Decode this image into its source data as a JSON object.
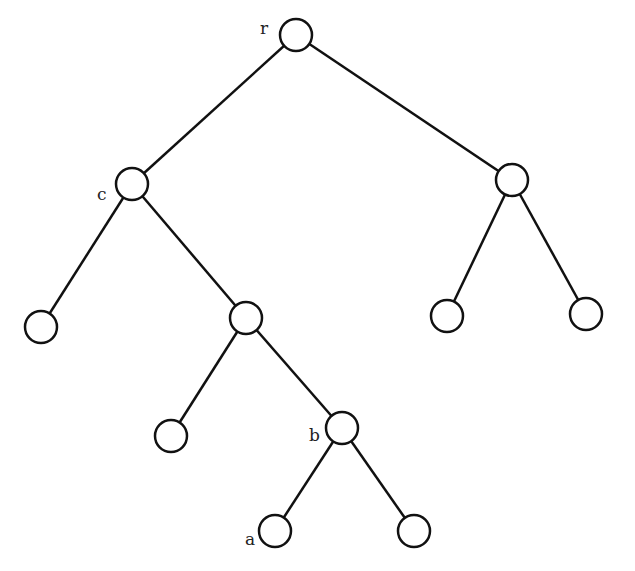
{
  "diagram": {
    "type": "binary-tree",
    "nodes": [
      {
        "id": "r",
        "label": "r",
        "x": 296,
        "y": 35
      },
      {
        "id": "c",
        "label": "c",
        "x": 132,
        "y": 184
      },
      {
        "id": "n2",
        "label": "",
        "x": 512,
        "y": 180
      },
      {
        "id": "n3",
        "label": "",
        "x": 41,
        "y": 327
      },
      {
        "id": "n4",
        "label": "",
        "x": 246,
        "y": 318
      },
      {
        "id": "n5",
        "label": "",
        "x": 447,
        "y": 316
      },
      {
        "id": "n6",
        "label": "",
        "x": 586,
        "y": 314
      },
      {
        "id": "n7",
        "label": "",
        "x": 171,
        "y": 436
      },
      {
        "id": "b",
        "label": "b",
        "x": 342,
        "y": 428
      },
      {
        "id": "a",
        "label": "a",
        "x": 275,
        "y": 531
      },
      {
        "id": "n9",
        "label": "",
        "x": 414,
        "y": 531
      }
    ],
    "edges": [
      [
        "r",
        "c"
      ],
      [
        "r",
        "n2"
      ],
      [
        "c",
        "n3"
      ],
      [
        "c",
        "n4"
      ],
      [
        "n2",
        "n5"
      ],
      [
        "n2",
        "n6"
      ],
      [
        "n4",
        "n7"
      ],
      [
        "n4",
        "b"
      ],
      [
        "b",
        "a"
      ],
      [
        "b",
        "n9"
      ]
    ],
    "labels": {
      "r": "r",
      "c": "c",
      "b": "b",
      "a": "a"
    }
  }
}
